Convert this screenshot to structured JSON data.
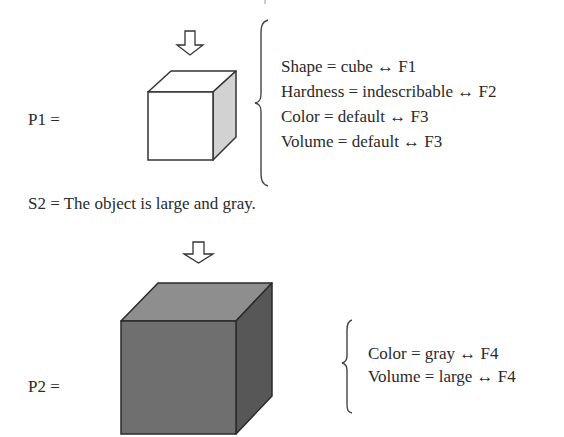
{
  "panel1": {
    "label": "P1 =",
    "attributes": [
      "Shape = cube ↔ F1",
      "Hardness = indescribable ↔ F2",
      "Color = default ↔ F3",
      "Volume = default ↔ F3"
    ],
    "cube_colors": {
      "top": "#ffffff",
      "front": "#ffffff",
      "side": "#d2d2d2",
      "stroke": "#333333"
    }
  },
  "statement": {
    "text": "S2 = The object is large and gray."
  },
  "panel2": {
    "label": "P2 =",
    "attributes": [
      "Color = gray ↔ F4",
      "Volume = large ↔ F4"
    ],
    "cube_colors": {
      "top": "#8e8e8e",
      "front": "#6f6f6f",
      "side": "#575757",
      "stroke": "#2a2a2a"
    }
  },
  "icons": {
    "arrow1": "down-arrow-icon",
    "arrow2": "down-arrow-icon",
    "brace1": "left-curly-brace",
    "brace2": "left-curly-brace"
  }
}
